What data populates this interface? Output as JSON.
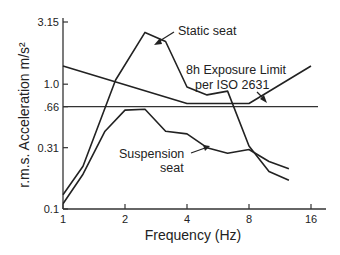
{
  "chart_data": {
    "type": "line",
    "title": "",
    "xlabel": "Frequency (Hz)",
    "ylabel": "r.m.s. Acceleration m/s²",
    "xscale": "log2",
    "yscale": "log",
    "xlim": [
      1,
      18
    ],
    "ylim": [
      0.1,
      3.15
    ],
    "x_ticks": [
      {
        "value": 1,
        "label": "1"
      },
      {
        "value": 2,
        "label": "2"
      },
      {
        "value": 4,
        "label": "4"
      },
      {
        "value": 8,
        "label": "8"
      },
      {
        "value": 16,
        "label": "16"
      }
    ],
    "y_ticks": [
      {
        "value": 3.15,
        "label": "3.15"
      },
      {
        "value": 1.0,
        "label": "1.0"
      },
      {
        "value": 0.66,
        "label": ".66"
      },
      {
        "value": 0.31,
        "label": "0.31"
      },
      {
        "value": 0.1,
        "label": "0.1"
      }
    ],
    "grid": false,
    "reference_line": {
      "y": 0.66,
      "label": ".66"
    },
    "series": [
      {
        "name": "Static seat",
        "x": [
          1,
          1.25,
          1.8,
          2.5,
          3.15,
          4,
          5,
          6.3,
          8,
          10,
          12.5
        ],
        "y": [
          0.13,
          0.22,
          1.08,
          2.6,
          2.2,
          0.95,
          0.82,
          0.88,
          0.32,
          0.2,
          0.17
        ]
      },
      {
        "name": "Suspension seat",
        "x": [
          1,
          1.25,
          1.6,
          2,
          2.5,
          3.15,
          4,
          5,
          6.3,
          8,
          10,
          12.5
        ],
        "y": [
          0.11,
          0.19,
          0.42,
          0.62,
          0.63,
          0.42,
          0.4,
          0.31,
          0.28,
          0.3,
          0.24,
          0.21
        ]
      },
      {
        "name": "8h Exposure Limit per ISO 2631",
        "x": [
          1,
          4,
          8,
          16
        ],
        "y": [
          1.4,
          0.7,
          0.7,
          1.4
        ]
      }
    ],
    "annotations": [
      {
        "text": "Static seat",
        "arrow": true
      },
      {
        "text": "8h Exposure Limit",
        "arrow": false
      },
      {
        "text": "per ISO 2631",
        "arrow": true
      },
      {
        "text": "Suspension",
        "arrow": true
      },
      {
        "text": "seat",
        "arrow": false
      }
    ]
  }
}
